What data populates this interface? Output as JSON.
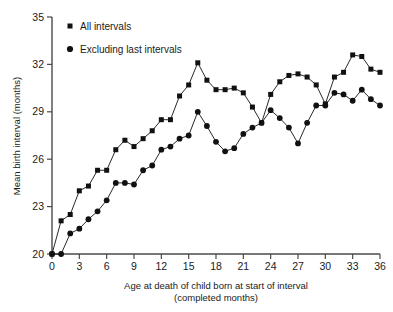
{
  "chart_data": {
    "type": "line",
    "title": "",
    "xlabel": "Age at death of child born at start of interval (completed months)",
    "xlabel_line1": "Age at death of child born at start of interval",
    "xlabel_line2": "(completed months)",
    "ylabel": "Mean birth interval (months)",
    "xlim": [
      0,
      36
    ],
    "ylim": [
      20,
      35
    ],
    "xticks": [
      0,
      3,
      6,
      9,
      12,
      15,
      18,
      21,
      24,
      27,
      30,
      33,
      36
    ],
    "xtick_labels": [
      "0",
      "3",
      "6",
      "9",
      "12",
      "15",
      "18",
      "21",
      "24",
      "27",
      "30",
      "33",
      "36"
    ],
    "yticks": [
      20,
      23,
      26,
      29,
      32,
      35
    ],
    "ytick_labels": [
      "20",
      "23",
      "26",
      "29",
      "32",
      "35"
    ],
    "grid": false,
    "legend_position": "top-left",
    "x": [
      0,
      1,
      2,
      3,
      4,
      5,
      6,
      7,
      8,
      9,
      10,
      11,
      12,
      13,
      14,
      15,
      16,
      17,
      18,
      19,
      20,
      21,
      22,
      23,
      24,
      25,
      26,
      27,
      28,
      29,
      30,
      31,
      32,
      33,
      34,
      35,
      36
    ],
    "series": [
      {
        "name": "All intervals",
        "marker": "square",
        "values": [
          20.0,
          22.1,
          22.5,
          24.0,
          24.3,
          25.3,
          25.3,
          26.6,
          27.2,
          26.8,
          27.3,
          27.8,
          28.5,
          28.5,
          30.0,
          30.7,
          32.1,
          31.0,
          30.4,
          30.4,
          30.5,
          30.2,
          29.3,
          28.3,
          30.1,
          30.9,
          31.3,
          31.4,
          31.2,
          30.7,
          29.5,
          31.2,
          31.5,
          32.6,
          32.5,
          31.7,
          31.5
        ]
      },
      {
        "name": "Excluding last intervals",
        "marker": "circle",
        "values": [
          20.0,
          20.0,
          21.3,
          21.6,
          22.2,
          22.7,
          23.4,
          24.5,
          24.5,
          24.4,
          25.3,
          25.6,
          26.6,
          26.8,
          27.3,
          27.5,
          29.0,
          28.1,
          27.1,
          26.5,
          26.7,
          27.6,
          28.0,
          28.3,
          29.1,
          28.6,
          28.0,
          27.0,
          28.3,
          29.4,
          29.4,
          30.2,
          30.1,
          29.7,
          30.4,
          29.8,
          29.4
        ]
      }
    ]
  },
  "legend": {
    "items": [
      {
        "label": "All intervals",
        "marker": "square"
      },
      {
        "label": "Excluding last intervals",
        "marker": "circle"
      }
    ]
  }
}
